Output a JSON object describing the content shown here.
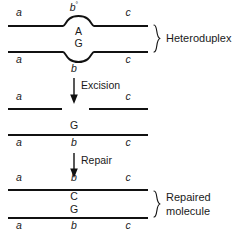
{
  "figure": {
    "line_color": "#111111",
    "text_color": "#1a1a1a",
    "background": "#ffffff"
  },
  "stages": {
    "heteroduplex": {
      "group_label": "Heteroduplex",
      "top_strand": {
        "left_marker": "a",
        "bulge_marker": "b",
        "bulge_marker_superscript": "°",
        "right_marker": "c",
        "base": "A",
        "bulge_direction": "up"
      },
      "bottom_strand": {
        "left_marker": "a",
        "bulge_marker": "b",
        "right_marker": "c",
        "base": "G",
        "bulge_direction": "down"
      }
    },
    "excision_step": {
      "arrow_label": "Excision",
      "arrow_direction": "down"
    },
    "excised": {
      "top_strand": {
        "left_marker": "a",
        "right_marker": "c",
        "gapped": true
      },
      "bottom_strand": {
        "left_marker": "a",
        "middle_marker": "b",
        "right_marker": "c",
        "base": "G",
        "gapped": false
      }
    },
    "repair_step": {
      "arrow_label": "Repair",
      "arrow_direction": "down"
    },
    "repaired": {
      "group_label_line1": "Repaired",
      "group_label_line2": "molecule",
      "top_strand": {
        "left_marker": "a",
        "middle_marker": "b",
        "right_marker": "c",
        "base": "C"
      },
      "bottom_strand": {
        "left_marker": "a",
        "middle_marker": "b",
        "right_marker": "c",
        "base": "G"
      }
    }
  }
}
